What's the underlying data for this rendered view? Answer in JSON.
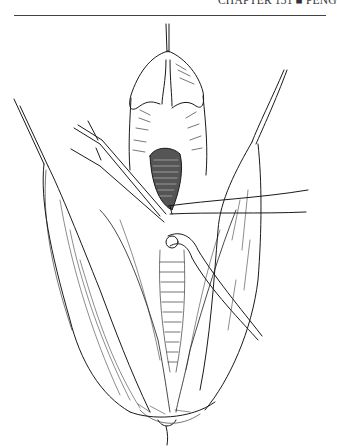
{
  "page": {
    "running_head": "CHAPTER 131 ■ PENG",
    "figure": {
      "type": "surgical line illustration",
      "description": "Pen-and-ink drawing of an operative field with traction sutures and retracted tissue flaps, vessel loops passed beneath exposed structures"
    }
  },
  "colors": {
    "ink": "#1a1a1a",
    "paper": "#ffffff",
    "rule": "#444444"
  }
}
